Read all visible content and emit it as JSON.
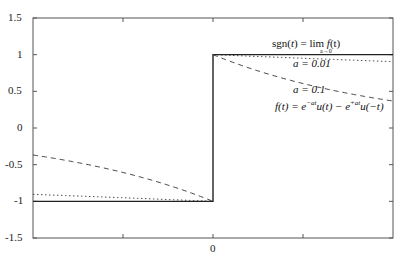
{
  "chart_data": {
    "type": "line",
    "title": "",
    "xlabel": "",
    "ylabel": "",
    "xlim": [
      -10,
      10
    ],
    "ylim": [
      -1.5,
      1.5
    ],
    "x_ticks": [
      -5,
      0,
      5
    ],
    "x_tick_labels": [
      "",
      "0",
      ""
    ],
    "y_ticks": [
      -1.5,
      -1,
      -0.5,
      0,
      0.5,
      1,
      1.5
    ],
    "y_tick_labels": [
      "-1.5",
      "-1",
      "-0.5",
      "0",
      "0.5",
      "1",
      "1.5"
    ],
    "grid": false,
    "series": [
      {
        "name": "sgn(t)",
        "style": "solid",
        "description": "sign function: -1 for t<0, +1 for t>0",
        "x": [
          -10,
          0,
          0,
          10
        ],
        "y": [
          -1,
          -1,
          1,
          1
        ]
      },
      {
        "name": "a = 0.01",
        "style": "dotted",
        "description": "f(t) = e^{-0.01 t} u(t) - e^{0.01 t} u(-t)",
        "x": [
          -10,
          -5,
          0,
          0,
          5,
          10
        ],
        "y": [
          -0.905,
          -0.951,
          -1,
          1,
          0.951,
          0.905
        ]
      },
      {
        "name": "a = 0.1",
        "style": "dashed",
        "description": "f(t) = e^{-0.1 t} u(t) - e^{0.1 t} u(-t)",
        "x": [
          -10,
          -5,
          0,
          0,
          5,
          10
        ],
        "y": [
          -0.368,
          -0.607,
          -1,
          1,
          0.607,
          0.368
        ]
      }
    ],
    "annotations": [
      {
        "text": "sgn(t) = lim_{a→0} f(t)",
        "x": 5,
        "y": 1.2
      },
      {
        "text": "a = 0.01",
        "x": 5,
        "y": 0.85
      },
      {
        "text": "a = 0.1",
        "x": 5,
        "y": 0.5
      },
      {
        "text": "f(t) = e^{-at}u(t) - e^{+at}u(-t)",
        "x": 5,
        "y": 0.3
      }
    ]
  },
  "labels": {
    "y": [
      "1.5",
      "1",
      "0.5",
      "0",
      "-0.5",
      "-1",
      "-1.5"
    ],
    "x_zero": "0",
    "ann_sgn_left": "sgn(",
    "ann_sgn_t": "t",
    "ann_sgn_mid": ") = lim ",
    "ann_sgn_f": "f",
    "ann_sgn_end": "(t)",
    "ann_sgn_sub": "a→0",
    "ann_a001": "a = 0.01",
    "ann_a01": "a = 0.1",
    "ann_f": "f(t) = e",
    "ann_f_sup1": "−at",
    "ann_f_mid": "u(t) − e",
    "ann_f_sup2": "+at",
    "ann_f_end": "u(−t)"
  }
}
